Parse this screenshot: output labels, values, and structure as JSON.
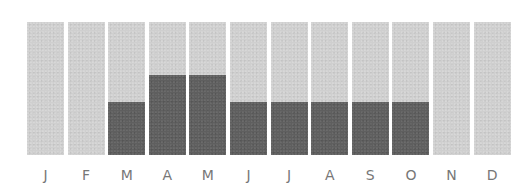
{
  "chart_data": {
    "type": "bar",
    "title": "",
    "xlabel": "",
    "ylabel": "",
    "categories": [
      "J",
      "F",
      "M",
      "A",
      "M",
      "J",
      "J",
      "A",
      "S",
      "O",
      "N",
      "D"
    ],
    "series": [
      {
        "name": "background",
        "values": [
          100,
          100,
          100,
          100,
          100,
          100,
          100,
          100,
          100,
          100,
          100,
          100
        ],
        "color": "#cfcfcf"
      },
      {
        "name": "value",
        "values": [
          0,
          0,
          40,
          60,
          60,
          40,
          40,
          40,
          40,
          40,
          0,
          0
        ],
        "color": "#5f5f5f"
      }
    ],
    "ylim": [
      0,
      100
    ],
    "grid": false,
    "legend": "none"
  },
  "colors": {
    "background_bar": "#cfcfcf",
    "value_bar": "#5f5f5f",
    "label": "#777777"
  }
}
